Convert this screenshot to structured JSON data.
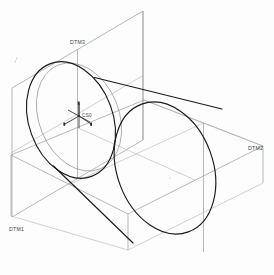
{
  "viewport": {
    "title": "CAD 3D Model Viewport",
    "background_color": "#fdfdfd",
    "width": 274,
    "height": 275
  },
  "model": {
    "primitive": "cylinder",
    "description": "Isometric view of a cylinder with three reference datum planes and a coordinate system",
    "edge_color": "#1a1a1a",
    "datum_color": "#9a9a9a",
    "hidden_edge_color": "#8f8f8f"
  },
  "labels": {
    "datum3": "DTM3",
    "datum2": "DTM2",
    "datum1": "DTM1",
    "csys": "CS0"
  },
  "datum_planes": [
    {
      "name": "DTM3",
      "label": "DTM3",
      "orientation": "vertical-front",
      "label_x": 70,
      "label_y": 43
    },
    {
      "name": "DTM2",
      "label": "DTM2",
      "orientation": "vertical-right",
      "label_x": 248,
      "label_y": 148
    },
    {
      "name": "DTM1",
      "label": "DTM1",
      "orientation": "horizontal-base",
      "label_x": 9,
      "label_y": 230
    }
  ],
  "coordinate_system": {
    "name": "CS0",
    "label": "CS0",
    "origin_x": 79,
    "origin_y": 116,
    "axes": [
      "x",
      "y",
      "z"
    ]
  }
}
